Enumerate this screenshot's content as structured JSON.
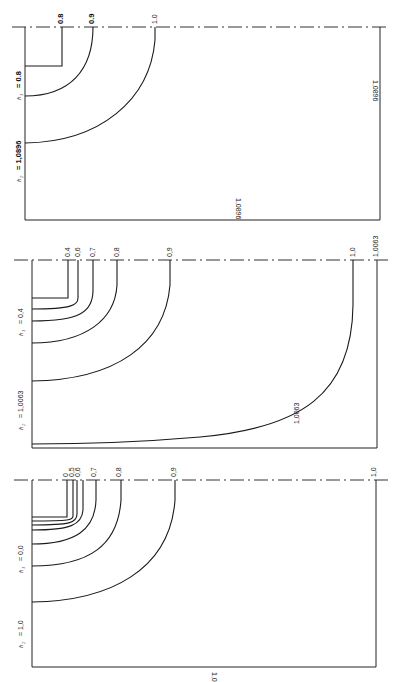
{
  "figure": {
    "orientation": "rotated-90",
    "panels": [
      {
        "id": "panel-1",
        "param_h2_label": "h",
        "param_h2_sub": "2",
        "param_h2_value": "= 1,0896",
        "param_h1_label": "h",
        "param_h1_sub": "1",
        "param_h1_value": "= 0.8",
        "contour_labels": [
          "0.8",
          "0.9",
          "1.0"
        ],
        "boundary_label_right": "1,0896",
        "boundary_label_bottom": "1,0896"
      },
      {
        "id": "panel-2",
        "param_h2_label": "h",
        "param_h2_sub": "2",
        "param_h2_value": "= 1,0063",
        "param_h1_label": "h",
        "param_h1_sub": "1",
        "param_h1_value": "= 0,4",
        "contour_labels": [
          "0.4",
          "0,6",
          "0,7",
          "0,8",
          "0,9",
          "1,0",
          "1,0063"
        ],
        "boundary_label_bottom": "1,0063"
      },
      {
        "id": "panel-3",
        "param_h2_label": "h",
        "param_h2_sub": "2",
        "param_h2_value": "= 1,0",
        "param_h1_label": "h",
        "param_h1_sub": "1",
        "param_h1_value": "= 0,0",
        "contour_labels": [
          "0",
          "0,5",
          "0,6",
          "0,7",
          "0,8",
          "0,9",
          "1,0"
        ],
        "boundary_label_bottom": "1,0"
      }
    ]
  }
}
